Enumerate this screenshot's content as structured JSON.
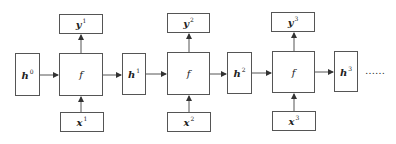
{
  "diagram": {
    "type": "recurrent-unrolled-flow",
    "hidden_states": [
      {
        "label": "h",
        "sup": "0"
      },
      {
        "label": "h",
        "sup": "1"
      },
      {
        "label": "h",
        "sup": "2"
      },
      {
        "label": "h",
        "sup": "3"
      }
    ],
    "steps": [
      {
        "function": "f",
        "input": {
          "label": "x",
          "sup": "1"
        },
        "output": {
          "label": "y",
          "sup": "1"
        }
      },
      {
        "function": "f",
        "input": {
          "label": "x",
          "sup": "2"
        },
        "output": {
          "label": "y",
          "sup": "2"
        }
      },
      {
        "function": "f",
        "input": {
          "label": "x",
          "sup": "3"
        },
        "output": {
          "label": "y",
          "sup": "3"
        }
      }
    ],
    "continuation": "……",
    "colors": {
      "stroke": "#555555",
      "arrow": "#333333",
      "background": "#ffffff"
    }
  }
}
